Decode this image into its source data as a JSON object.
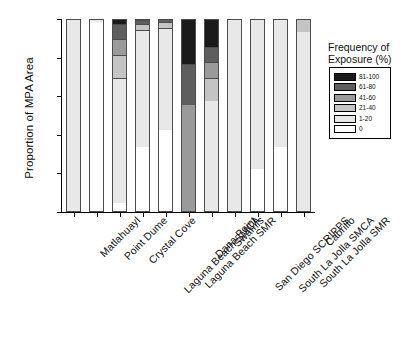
{
  "chart_data": {
    "type": "bar",
    "subtype": "stacked-bar-100",
    "title": "",
    "xlabel": "",
    "ylabel": "Proportion of MPA Area",
    "ylim": [
      0,
      1
    ],
    "yticks": [
      "0.0",
      "0.2",
      "0.4",
      "0.6",
      "0.8",
      "1.0"
    ],
    "ytick_values": [
      0,
      0.2,
      0.4,
      0.6,
      0.8,
      1
    ],
    "grid": false,
    "legend_position": "right",
    "legend_title": "Frequency of Exposure (%)",
    "categories": [
      "Matlahuayl",
      "Point Dume",
      "Crystal Cove",
      "Laguna Beach SMCA",
      "Laguna Beach SMR",
      "Dana Point",
      "Swamis",
      "San Diego SCRIPPS",
      "South La Jolla SMCA",
      "South La Jolla SMR",
      "Cabrillo"
    ],
    "series": [
      {
        "name": "0",
        "color": "#ffffff",
        "values": [
          0.0,
          0.98,
          0.04,
          0.33,
          0.42,
          0.0,
          0.0,
          0.0,
          0.22,
          0.33,
          0.0
        ]
      },
      {
        "name": "1-20",
        "color": "#e8e8e8",
        "values": [
          1.0,
          0.02,
          0.65,
          0.61,
          0.53,
          0.0,
          0.57,
          1.0,
          0.78,
          0.67,
          0.93
        ]
      },
      {
        "name": "21-40",
        "color": "#c4c4c4",
        "values": [
          0.0,
          0.0,
          0.12,
          0.03,
          0.03,
          0.0,
          0.12,
          0.0,
          0.0,
          0.0,
          0.07
        ]
      },
      {
        "name": "41-60",
        "color": "#9a9a9a",
        "values": [
          0.0,
          0.0,
          0.08,
          0.0,
          0.0,
          0.55,
          0.08,
          0.0,
          0.0,
          0.0,
          0.0
        ]
      },
      {
        "name": "61-80",
        "color": "#5e5e5e",
        "values": [
          0.0,
          0.0,
          0.08,
          0.02,
          0.02,
          0.21,
          0.08,
          0.0,
          0.0,
          0.0,
          0.0
        ]
      },
      {
        "name": "81-100",
        "color": "#1a1a1a",
        "values": [
          0.0,
          0.0,
          0.03,
          0.01,
          0.0,
          0.24,
          0.15,
          0.0,
          0.0,
          0.0,
          0.0
        ]
      }
    ],
    "legend_entries": [
      {
        "label": "81-100",
        "color": "#1a1a1a"
      },
      {
        "label": "61-80",
        "color": "#5e5e5e"
      },
      {
        "label": "41-60",
        "color": "#9a9a9a"
      },
      {
        "label": "21-40",
        "color": "#c4c4c4"
      },
      {
        "label": "1-20",
        "color": "#e8e8e8"
      },
      {
        "label": "0",
        "color": "#ffffff"
      }
    ]
  }
}
